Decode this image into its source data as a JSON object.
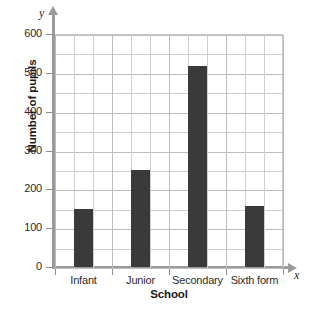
{
  "chart_data": {
    "type": "bar",
    "title": "",
    "xlabel": "School",
    "ylabel": "Number of pupils",
    "categories": [
      "Infant",
      "Junior",
      "Secondary",
      "Sixth form"
    ],
    "values": [
      150,
      250,
      518,
      157
    ],
    "ylim": [
      0,
      600
    ],
    "yticks": [
      0,
      100,
      200,
      300,
      400,
      500,
      600
    ],
    "ytick_labels": [
      "0",
      "100",
      "200",
      "300",
      "400",
      "500",
      "600"
    ],
    "y_minor_step": 50,
    "grid": true,
    "legend": null,
    "bar_color": "#3a3a3a",
    "grid_color": "#cfcfcf",
    "axis_color": "#9a9a9a",
    "axis_letters": {
      "y": "y",
      "x": "x"
    }
  }
}
